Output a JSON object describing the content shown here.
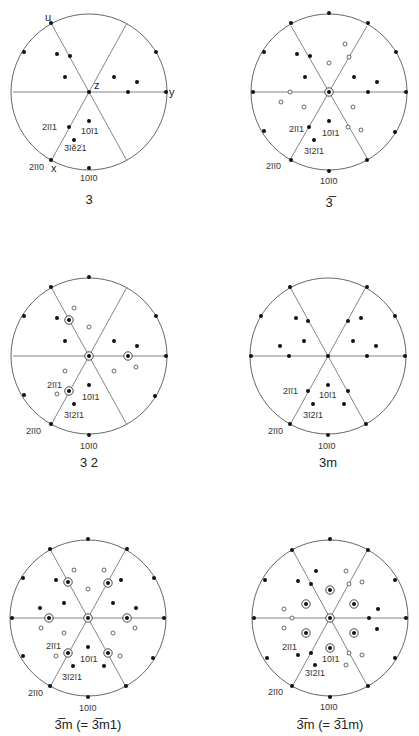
{
  "figure": {
    "radius": 76,
    "panels": [
      {
        "id": "p3",
        "caption": "3",
        "center": [
          89,
          92
        ],
        "lines": [
          [
            -38,
            -69,
            38,
            69
          ],
          [
            38,
            -69,
            -38,
            69
          ],
          [
            -76,
            0,
            76,
            0
          ]
        ],
        "filled": [
          [
            -38,
            -69
          ],
          [
            -65,
            -40
          ],
          [
            67,
            -40
          ],
          [
            77,
            0
          ],
          [
            -38,
            68
          ],
          [
            0,
            76
          ],
          [
            0,
            0
          ],
          [
            -32,
            -38
          ],
          [
            -19,
            -36
          ],
          [
            -24,
            -15
          ],
          [
            25,
            -15
          ],
          [
            48,
            -10
          ],
          [
            39,
            0
          ],
          [
            0,
            29
          ],
          [
            -20,
            35
          ],
          [
            -15,
            48
          ]
        ],
        "open": [],
        "ringed": [],
        "labels": [
          {
            "text": "u",
            "x": -44,
            "y": -71,
            "cls": "axl"
          },
          {
            "text": "z",
            "x": 5,
            "y": -3,
            "cls": "axl"
          },
          {
            "text": "y",
            "x": 80,
            "y": 4,
            "cls": "axl"
          },
          {
            "text": "x",
            "x": -38,
            "y": 80,
            "cls": "axl"
          },
          {
            "text": "2īī1",
            "x": -47,
            "y": 38,
            "cls": "lbl"
          },
          {
            "text": "10ī1",
            "x": -8,
            "y": 42,
            "cls": "lbl"
          },
          {
            "text": "3īĕ2̇​1",
            "x": -25,
            "y": 59,
            "cls": "lbl"
          },
          {
            "text": "2īī0",
            "x": -60,
            "y": 78,
            "cls": "lbl"
          },
          {
            "text": "10ī0",
            "x": -9,
            "y": 89,
            "cls": "lbl"
          }
        ]
      },
      {
        "id": "p3bar",
        "caption": "3̅",
        "center": [
          329,
          92
        ],
        "lines": [
          [
            -38,
            -66,
            38,
            66
          ],
          [
            38,
            -66,
            -38,
            66
          ],
          [
            -76,
            0,
            76,
            0
          ]
        ],
        "filled": [
          [
            0,
            -79
          ],
          [
            -38,
            -69
          ],
          [
            39,
            -69
          ],
          [
            -65,
            -40
          ],
          [
            67,
            -40
          ],
          [
            -76,
            0
          ],
          [
            77,
            0
          ],
          [
            -65,
            39
          ],
          [
            66,
            40
          ],
          [
            -38,
            68
          ],
          [
            38,
            68
          ],
          [
            0,
            79
          ],
          [
            -32,
            -38
          ],
          [
            -19,
            -36
          ],
          [
            -24,
            -15
          ],
          [
            25,
            -15
          ],
          [
            48,
            -10
          ],
          [
            39,
            0
          ],
          [
            0,
            29
          ],
          [
            -20,
            35
          ],
          [
            -15,
            48
          ]
        ],
        "open": [
          [
            16,
            -48
          ],
          [
            20,
            -35
          ],
          [
            0,
            -29
          ],
          [
            -39,
            0
          ],
          [
            -48,
            10
          ],
          [
            -25,
            15
          ],
          [
            24,
            15
          ],
          [
            19,
            35
          ],
          [
            32,
            38
          ]
        ],
        "ringed": [
          [
            0,
            0
          ]
        ],
        "labels": [
          {
            "text": "2īī1",
            "x": -40,
            "y": 40
          },
          {
            "text": "10ī1",
            "x": -7,
            "y": 44
          },
          {
            "text": "3ī2ī1",
            "x": -25,
            "y": 62
          },
          {
            "text": "2īī0",
            "x": -63,
            "y": 77
          },
          {
            "text": "10ī0",
            "x": -9,
            "y": 92
          }
        ]
      },
      {
        "id": "p32",
        "caption": "3 2",
        "center": [
          89,
          356
        ],
        "lines": [
          [
            -38,
            -69,
            38,
            69
          ],
          [
            38,
            -69,
            -38,
            69
          ],
          [
            -76,
            0,
            76,
            0
          ]
        ],
        "filled": [
          [
            0,
            -79
          ],
          [
            -38,
            -69
          ],
          [
            -65,
            -40
          ],
          [
            67,
            -40
          ],
          [
            77,
            0
          ],
          [
            -65,
            39
          ],
          [
            66,
            40
          ],
          [
            -38,
            68
          ],
          [
            0,
            79
          ],
          [
            -32,
            -38
          ],
          [
            -24,
            -15
          ],
          [
            25,
            -15
          ],
          [
            48,
            -10
          ],
          [
            0,
            29
          ],
          [
            -15,
            48
          ]
        ],
        "open": [
          [
            -15,
            -48
          ],
          [
            0,
            -29
          ],
          [
            -24,
            15
          ],
          [
            25,
            15
          ],
          [
            47,
            11
          ],
          [
            -32,
            38
          ]
        ],
        "ringed": [
          [
            -20,
            -36
          ],
          [
            39,
            0
          ],
          [
            0,
            0
          ],
          [
            -20,
            35
          ]
        ],
        "labels": [
          {
            "text": "2īī1",
            "x": -42,
            "y": 32
          },
          {
            "text": "10ī1",
            "x": -7,
            "y": 44
          },
          {
            "text": "3ī2ī1",
            "x": -25,
            "y": 62
          },
          {
            "text": "2īī0",
            "x": -63,
            "y": 78
          },
          {
            "text": "10ī0",
            "x": -9,
            "y": 93
          }
        ]
      },
      {
        "id": "p3m",
        "caption": "3m",
        "center": [
          328,
          356
        ],
        "lines": [
          [
            -38,
            -69,
            38,
            69
          ],
          [
            38,
            -69,
            -38,
            69
          ],
          [
            -76,
            0,
            76,
            0
          ]
        ],
        "filled": [
          [
            -38,
            -69
          ],
          [
            39,
            -69
          ],
          [
            -67,
            -40
          ],
          [
            67,
            -40
          ],
          [
            -77,
            0
          ],
          [
            77,
            0
          ],
          [
            -38,
            68
          ],
          [
            38,
            68
          ],
          [
            0,
            79
          ],
          [
            0,
            0
          ],
          [
            -32,
            -38
          ],
          [
            -20,
            -35
          ],
          [
            20,
            -35
          ],
          [
            33,
            -38
          ],
          [
            -24,
            -15
          ],
          [
            25,
            -15
          ],
          [
            -48,
            -10
          ],
          [
            48,
            -10
          ],
          [
            -39,
            0
          ],
          [
            39,
            0
          ],
          [
            0,
            29
          ],
          [
            -20,
            35
          ],
          [
            20,
            35
          ],
          [
            16,
            48
          ],
          [
            -15,
            48
          ]
        ],
        "open": [],
        "ringed": [],
        "labels": [
          {
            "text": "2īī1",
            "x": -45,
            "y": 38
          },
          {
            "text": "10ī1",
            "x": -9,
            "y": 42
          },
          {
            "text": "3ī2ī1",
            "x": -25,
            "y": 62
          },
          {
            "text": "2īī0",
            "x": -60,
            "y": 78
          },
          {
            "text": "10ī0",
            "x": -10,
            "y": 93
          }
        ]
      },
      {
        "id": "p3barm1",
        "caption": "3̅m (= 3̅m1)",
        "center": [
          88,
          618
        ],
        "lines": [
          [
            -38,
            -69,
            38,
            69
          ],
          [
            38,
            -69,
            -38,
            69
          ],
          [
            -76,
            0,
            76,
            0
          ]
        ],
        "filled": [
          [
            0,
            -79
          ],
          [
            -38,
            -69
          ],
          [
            39,
            -69
          ],
          [
            -65,
            -40
          ],
          [
            66,
            -40
          ],
          [
            -76,
            0
          ],
          [
            76,
            0
          ],
          [
            -65,
            38
          ],
          [
            65,
            40
          ],
          [
            -38,
            68
          ],
          [
            38,
            68
          ],
          [
            0,
            79
          ],
          [
            -32,
            -38
          ],
          [
            33,
            -38
          ],
          [
            -48,
            -10
          ],
          [
            -24,
            -15
          ],
          [
            25,
            -15
          ],
          [
            48,
            -10
          ],
          [
            0,
            29
          ],
          [
            -15,
            48
          ],
          [
            16,
            48
          ]
        ],
        "open": [
          [
            -14,
            -48
          ],
          [
            16,
            -48
          ],
          [
            0,
            -29
          ],
          [
            -47,
            10
          ],
          [
            -24,
            15
          ],
          [
            25,
            15
          ],
          [
            47,
            10
          ],
          [
            -32,
            38
          ],
          [
            32,
            38
          ]
        ],
        "ringed": [
          [
            -20,
            -36
          ],
          [
            20,
            -35
          ],
          [
            -39,
            0
          ],
          [
            0,
            0
          ],
          [
            39,
            0
          ],
          [
            -20,
            35
          ],
          [
            20,
            35
          ]
        ],
        "labels": [
          {
            "text": "2īī1",
            "x": -42,
            "y": 31
          },
          {
            "text": "10ī1",
            "x": -8,
            "y": 44
          },
          {
            "text": "3ī2ī1",
            "x": -26,
            "y": 62
          },
          {
            "text": "2īī0",
            "x": -60,
            "y": 78
          },
          {
            "text": "10ī0",
            "x": -9,
            "y": 93
          }
        ]
      },
      {
        "id": "p3bar1m",
        "caption": "3̅m (= 3̅1m)",
        "center": [
          330,
          618
        ],
        "lines": [
          [
            -38,
            -69,
            38,
            69
          ],
          [
            38,
            -69,
            -38,
            69
          ],
          [
            -76,
            0,
            76,
            0
          ]
        ],
        "filled": [
          [
            0,
            -79
          ],
          [
            -38,
            -68
          ],
          [
            38,
            -68
          ],
          [
            -65,
            -38
          ],
          [
            65,
            -38
          ],
          [
            -76,
            0
          ],
          [
            76,
            0
          ],
          [
            -63,
            40
          ],
          [
            65,
            40
          ],
          [
            -38,
            68
          ],
          [
            38,
            68
          ],
          [
            0,
            79
          ],
          [
            -14,
            -47
          ],
          [
            -32,
            -37
          ],
          [
            -19,
            -34
          ],
          [
            48,
            -9
          ],
          [
            39,
            0
          ],
          [
            47,
            11
          ],
          [
            -32,
            37
          ],
          [
            -19,
            35
          ],
          [
            -15,
            47
          ]
        ],
        "open": [
          [
            16,
            -47
          ],
          [
            19,
            -34
          ],
          [
            32,
            -36
          ],
          [
            -46,
            -9
          ],
          [
            -38,
            0
          ],
          [
            -46,
            10
          ],
          [
            19,
            35
          ],
          [
            32,
            37
          ],
          [
            16,
            47
          ]
        ],
        "ringed": [
          [
            0,
            -28
          ],
          [
            -24,
            -14
          ],
          [
            24,
            -14
          ],
          [
            0,
            0
          ],
          [
            -24,
            15
          ],
          [
            24,
            15
          ],
          [
            0,
            30
          ]
        ],
        "labels": [
          {
            "text": "2īī1",
            "x": -48,
            "y": 32
          },
          {
            "text": "10ī1",
            "x": -8,
            "y": 44
          },
          {
            "text": "3ī2ī1",
            "x": -25,
            "y": 58
          },
          {
            "text": "2īī0",
            "x": -62,
            "y": 77
          },
          {
            "text": "10ī0",
            "x": -10,
            "y": 92
          }
        ]
      }
    ]
  }
}
